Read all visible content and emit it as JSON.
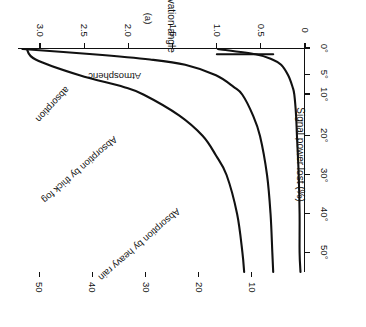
{
  "figure": {
    "caption": "(a)",
    "axes": {
      "power_loss": {
        "title": "Power loss (dB)",
        "ticks": [
          "3.0",
          "2.5",
          "2.0",
          "1.5",
          "1.0",
          "0.5",
          "0"
        ]
      },
      "signal_power_lost": {
        "title": "Signal power lost (%)",
        "ticks": [
          "50",
          "40",
          "30",
          "20",
          "10"
        ]
      },
      "elevation_angle": {
        "title": "Elevation angle",
        "ticks": [
          "0°",
          "5°",
          "10°",
          "20°",
          "30°",
          "40°",
          "50°"
        ]
      }
    },
    "curve_labels": {
      "heavy_rain": "Absorption by heavy rain",
      "thick_fog": "Absorption by thick fog",
      "atmospheric": "Atmospheric",
      "atmospheric_tail": "absorption"
    }
  },
  "chart_data": {
    "type": "line",
    "title": "",
    "subtitle": "(a)",
    "orientation": "rotated-180",
    "xlabel": "Power loss (dB)",
    "xlabel_secondary": "Signal power lost (%)",
    "ylabel": "Elevation angle",
    "xlim": [
      0,
      3.25
    ],
    "xlim_secondary": [
      0,
      54
    ],
    "ylim": [
      0,
      55
    ],
    "xticks": [
      3.0,
      2.5,
      2.0,
      1.5,
      1.0,
      0.5,
      0
    ],
    "xticks_secondary": [
      50,
      40,
      30,
      20,
      10
    ],
    "yticks": [
      0,
      5,
      10,
      20,
      30,
      40,
      50
    ],
    "ytick_labels": [
      "0°",
      "5°",
      "10°",
      "20°",
      "30°",
      "40°",
      "50°"
    ],
    "ytick_nonlinear": true,
    "grid": false,
    "legend": "inline-curve-labels",
    "line_color": "#111111",
    "series": [
      {
        "name": "Absorption by heavy rain",
        "x_unit": "dB power loss",
        "y_unit": "degrees elevation angle",
        "points": [
          {
            "elevation": 0,
            "power_loss_db": 3.15,
            "signal_power_lost_pct": 51.5
          },
          {
            "elevation": 2,
            "power_loss_db": 3.05,
            "signal_power_lost_pct": 50.5
          },
          {
            "elevation": 5,
            "power_loss_db": 2.55,
            "signal_power_lost_pct": 44.5
          },
          {
            "elevation": 8,
            "power_loss_db": 2.05,
            "signal_power_lost_pct": 38.0
          },
          {
            "elevation": 10,
            "power_loss_db": 1.82,
            "signal_power_lost_pct": 34.0
          },
          {
            "elevation": 15,
            "power_loss_db": 1.42,
            "signal_power_lost_pct": 27.5
          },
          {
            "elevation": 20,
            "power_loss_db": 1.15,
            "signal_power_lost_pct": 23.0
          },
          {
            "elevation": 25,
            "power_loss_db": 1.0,
            "signal_power_lost_pct": 20.5
          },
          {
            "elevation": 30,
            "power_loss_db": 0.88,
            "signal_power_lost_pct": 18.5
          },
          {
            "elevation": 40,
            "power_loss_db": 0.76,
            "signal_power_lost_pct": 16.0
          },
          {
            "elevation": 50,
            "power_loss_db": 0.7,
            "signal_power_lost_pct": 15.0
          },
          {
            "elevation": 55,
            "power_loss_db": 0.68,
            "signal_power_lost_pct": 14.5
          }
        ]
      },
      {
        "name": "Absorption by thick fog",
        "x_unit": "dB power loss",
        "y_unit": "degrees elevation angle",
        "points": [
          {
            "elevation": 0,
            "power_loss_db": 3.2,
            "signal_power_lost_pct": 52.0
          },
          {
            "elevation": 1,
            "power_loss_db": 2.4,
            "signal_power_lost_pct": 42.5
          },
          {
            "elevation": 2,
            "power_loss_db": 1.75,
            "signal_power_lost_pct": 33.0
          },
          {
            "elevation": 3,
            "power_loss_db": 1.35,
            "signal_power_lost_pct": 26.5
          },
          {
            "elevation": 5,
            "power_loss_db": 1.0,
            "signal_power_lost_pct": 20.5
          },
          {
            "elevation": 8,
            "power_loss_db": 0.8,
            "signal_power_lost_pct": 16.5
          },
          {
            "elevation": 10,
            "power_loss_db": 0.7,
            "signal_power_lost_pct": 15.0
          },
          {
            "elevation": 15,
            "power_loss_db": 0.58,
            "signal_power_lost_pct": 12.5
          },
          {
            "elevation": 20,
            "power_loss_db": 0.5,
            "signal_power_lost_pct": 11.0
          },
          {
            "elevation": 30,
            "power_loss_db": 0.42,
            "signal_power_lost_pct": 9.2
          },
          {
            "elevation": 40,
            "power_loss_db": 0.38,
            "signal_power_lost_pct": 8.4
          },
          {
            "elevation": 50,
            "power_loss_db": 0.36,
            "signal_power_lost_pct": 8.0
          },
          {
            "elevation": 55,
            "power_loss_db": 0.35,
            "signal_power_lost_pct": 7.8
          }
        ]
      },
      {
        "name": "Atmospheric absorption",
        "x_unit": "dB power loss",
        "y_unit": "degrees elevation angle",
        "points": [
          {
            "elevation": 0,
            "power_loss_db": 0.98,
            "signal_power_lost_pct": 20.0
          },
          {
            "elevation": 1,
            "power_loss_db": 0.55,
            "signal_power_lost_pct": 12.0
          },
          {
            "elevation": 2,
            "power_loss_db": 0.36,
            "signal_power_lost_pct": 8.0
          },
          {
            "elevation": 3,
            "power_loss_db": 0.26,
            "signal_power_lost_pct": 5.8
          },
          {
            "elevation": 5,
            "power_loss_db": 0.18,
            "signal_power_lost_pct": 4.0
          },
          {
            "elevation": 8,
            "power_loss_db": 0.13,
            "signal_power_lost_pct": 3.0
          },
          {
            "elevation": 10,
            "power_loss_db": 0.11,
            "signal_power_lost_pct": 2.5
          },
          {
            "elevation": 15,
            "power_loss_db": 0.09,
            "signal_power_lost_pct": 2.0
          },
          {
            "elevation": 20,
            "power_loss_db": 0.08,
            "signal_power_lost_pct": 1.8
          },
          {
            "elevation": 30,
            "power_loss_db": 0.06,
            "signal_power_lost_pct": 1.4
          },
          {
            "elevation": 40,
            "power_loss_db": 0.05,
            "signal_power_lost_pct": 1.2
          },
          {
            "elevation": 50,
            "power_loss_db": 0.05,
            "signal_power_lost_pct": 1.1
          },
          {
            "elevation": 55,
            "power_loss_db": 0.04,
            "signal_power_lost_pct": 1.0
          }
        ]
      }
    ]
  }
}
